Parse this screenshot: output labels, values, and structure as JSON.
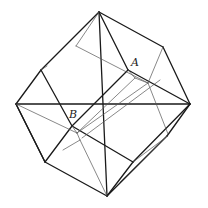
{
  "figure": {
    "type": "wireframe polyhedron (truncated cube / cube with inscribed diagonals)",
    "labels": {
      "A": "A",
      "B": "B"
    },
    "colors": {
      "edge": "#1a1a1a",
      "hidden_edge": "#555555",
      "background": "#ffffff"
    },
    "vertices": {
      "top": [
        99,
        12
      ],
      "left": [
        16,
        104
      ],
      "right": [
        190,
        104
      ],
      "bottom": [
        107,
        196
      ],
      "upper_left": [
        41,
        70
      ],
      "upper_right": [
        163,
        47
      ],
      "lower_left": [
        45,
        162
      ],
      "lower_right": [
        167,
        136
      ],
      "A": [
        128,
        70
      ],
      "B": [
        72,
        126
      ]
    }
  }
}
